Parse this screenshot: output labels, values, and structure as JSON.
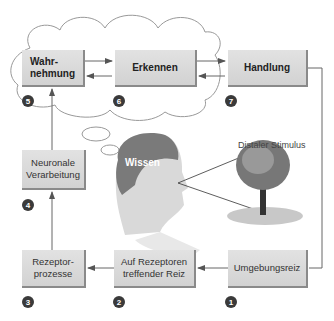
{
  "diagram": {
    "boxes": {
      "wahrnehmung": "Wahr-\nnehmung",
      "erkennen": "Erkennen",
      "handlung": "Handlung",
      "neuronale": "Neuronale\nVerarbeitung",
      "rezeptorprozesse": "Rezeptor-\nprozesse",
      "auf_rezeptoren": "Auf Rezeptoren\ntreffender Reiz",
      "umgebungsreiz": "Umgebungsreiz"
    },
    "badges": {
      "b1": "1",
      "b2": "2",
      "b3": "3",
      "b4": "4",
      "b5": "5",
      "b6": "6",
      "b7": "7"
    },
    "labels": {
      "distal": "Distaler Stimulus",
      "wissen": "Wissen"
    },
    "colors": {
      "box": "#d8d8d8",
      "arrow": "#666666",
      "badge": "#3a3a3a"
    }
  }
}
